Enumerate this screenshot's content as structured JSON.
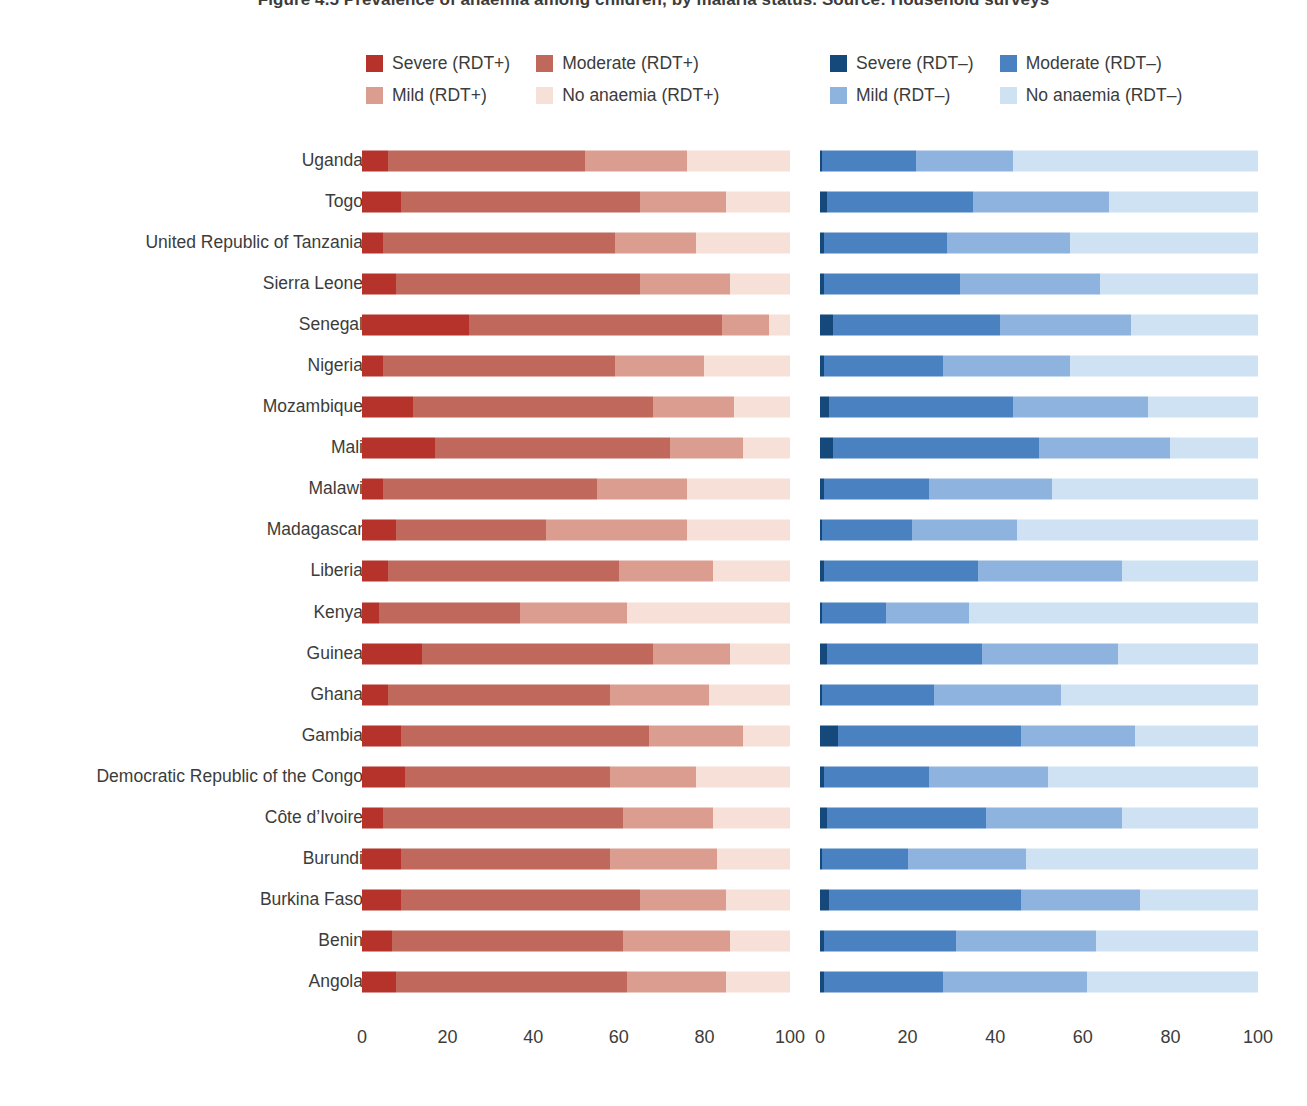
{
  "title": "Figure 4.5 Prevalence of anaemia among children, by malaria status. Source: Household surveys",
  "legend": {
    "rdt_positive": [
      {
        "label": "Severe (RDT+)",
        "color": "#b5332b",
        "key": "severe_pos"
      },
      {
        "label": "Moderate (RDT+)",
        "color": "#c0685c",
        "key": "moderate_pos"
      },
      {
        "label": "Mild (RDT+)",
        "color": "#da9d8f",
        "key": "mild_pos"
      },
      {
        "label": "No anaemia (RDT+)",
        "color": "#f6e0d8",
        "key": "none_pos"
      }
    ],
    "rdt_negative": [
      {
        "label": "Severe (RDT–)",
        "color": "#15497c",
        "key": "severe_neg"
      },
      {
        "label": "Moderate (RDT–)",
        "color": "#4a81c0",
        "key": "moderate_neg"
      },
      {
        "label": "Mild (RDT–)",
        "color": "#8db3de",
        "key": "mild_neg"
      },
      {
        "label": "No anaemia (RDT–)",
        "color": "#cee2f3",
        "key": "none_neg"
      }
    ]
  },
  "axis": {
    "ticks": [
      0,
      20,
      40,
      60,
      80,
      100
    ],
    "min": 0,
    "max": 100
  },
  "chart_data": {
    "type": "bar",
    "subtype": "stacked-horizontal-100pct",
    "title": "Figure 4.5 Prevalence of anaemia among children, by malaria status. Source: Household surveys",
    "xlabel": "",
    "ylabel": "",
    "xlim": [
      0,
      100
    ],
    "grid": false,
    "legend_position": "top",
    "panels": [
      {
        "name": "RDT-positive",
        "series": [
          {
            "name": "Severe (RDT+)",
            "color": "#b5332b"
          },
          {
            "name": "Moderate (RDT+)",
            "color": "#c0685c"
          },
          {
            "name": "Mild (RDT+)",
            "color": "#da9d8f"
          },
          {
            "name": "No anaemia (RDT+)",
            "color": "#f6e0d8"
          }
        ]
      },
      {
        "name": "RDT-negative",
        "series": [
          {
            "name": "Severe (RDT–)",
            "color": "#15497c"
          },
          {
            "name": "Moderate (RDT–)",
            "color": "#4a81c0"
          },
          {
            "name": "Mild (RDT–)",
            "color": "#8db3de"
          },
          {
            "name": "No anaemia (RDT–)",
            "color": "#cee2f3"
          }
        ]
      }
    ],
    "categories": [
      "Uganda",
      "Togo",
      "United Republic of Tanzania",
      "Sierra Leone",
      "Senegal",
      "Nigeria",
      "Mozambique",
      "Mali",
      "Malawi",
      "Madagascar",
      "Liberia",
      "Kenya",
      "Guinea",
      "Ghana",
      "Gambia",
      "Democratic Republic of the Congo",
      "Côte d’Ivoire",
      "Burundi",
      "Burkina Faso",
      "Benin",
      "Angola"
    ],
    "rows": [
      {
        "country": "Uganda",
        "rdt_pos": [
          6,
          46,
          24,
          24
        ],
        "rdt_neg": [
          0.5,
          21.5,
          22,
          56
        ]
      },
      {
        "country": "Togo",
        "rdt_pos": [
          9,
          56,
          20,
          15
        ],
        "rdt_neg": [
          1.5,
          33.5,
          31,
          34
        ]
      },
      {
        "country": "United Republic of Tanzania",
        "rdt_pos": [
          5,
          54,
          19,
          22
        ],
        "rdt_neg": [
          1,
          28,
          28,
          43
        ]
      },
      {
        "country": "Sierra Leone",
        "rdt_pos": [
          8,
          57,
          21,
          14
        ],
        "rdt_neg": [
          1,
          31,
          32,
          36
        ]
      },
      {
        "country": "Senegal",
        "rdt_pos": [
          25,
          59,
          11,
          5
        ],
        "rdt_neg": [
          3,
          38,
          30,
          29
        ]
      },
      {
        "country": "Nigeria",
        "rdt_pos": [
          5,
          54,
          21,
          20
        ],
        "rdt_neg": [
          1,
          27,
          29,
          43
        ]
      },
      {
        "country": "Mozambique",
        "rdt_pos": [
          12,
          56,
          19,
          13
        ],
        "rdt_neg": [
          2,
          42,
          31,
          25
        ]
      },
      {
        "country": "Mali",
        "rdt_pos": [
          17,
          55,
          17,
          11
        ],
        "rdt_neg": [
          3,
          47,
          30,
          20
        ]
      },
      {
        "country": "Malawi",
        "rdt_pos": [
          5,
          50,
          21,
          24
        ],
        "rdt_neg": [
          1,
          24,
          28,
          47
        ]
      },
      {
        "country": "Madagascar",
        "rdt_pos": [
          8,
          35,
          33,
          24
        ],
        "rdt_neg": [
          0.5,
          20.5,
          24,
          55
        ]
      },
      {
        "country": "Liberia",
        "rdt_pos": [
          6,
          54,
          22,
          18
        ],
        "rdt_neg": [
          1,
          35,
          33,
          31
        ]
      },
      {
        "country": "Kenya",
        "rdt_pos": [
          4,
          33,
          25,
          38
        ],
        "rdt_neg": [
          0.5,
          14.5,
          19,
          66
        ]
      },
      {
        "country": "Guinea",
        "rdt_pos": [
          14,
          54,
          18,
          14
        ],
        "rdt_neg": [
          1.5,
          35.5,
          31,
          32
        ]
      },
      {
        "country": "Ghana",
        "rdt_pos": [
          6,
          52,
          23,
          19
        ],
        "rdt_neg": [
          0.5,
          25.5,
          29,
          45
        ]
      },
      {
        "country": "Gambia",
        "rdt_pos": [
          9,
          58,
          22,
          11
        ],
        "rdt_neg": [
          4,
          42,
          26,
          28
        ]
      },
      {
        "country": "Democratic Republic of the Congo",
        "rdt_pos": [
          10,
          48,
          20,
          22
        ],
        "rdt_neg": [
          1,
          24,
          27,
          48
        ]
      },
      {
        "country": "Côte d’Ivoire",
        "rdt_pos": [
          5,
          56,
          21,
          18
        ],
        "rdt_neg": [
          1.5,
          36.5,
          31,
          31
        ]
      },
      {
        "country": "Burundi",
        "rdt_pos": [
          9,
          49,
          25,
          17
        ],
        "rdt_neg": [
          0.5,
          19.5,
          27,
          53
        ]
      },
      {
        "country": "Burkina Faso",
        "rdt_pos": [
          9,
          56,
          20,
          15
        ],
        "rdt_neg": [
          2,
          44,
          27,
          27
        ]
      },
      {
        "country": "Benin",
        "rdt_pos": [
          7,
          54,
          25,
          14
        ],
        "rdt_neg": [
          1,
          30,
          32,
          37
        ]
      },
      {
        "country": "Angola",
        "rdt_pos": [
          8,
          54,
          23,
          15
        ],
        "rdt_neg": [
          1,
          27,
          33,
          39
        ]
      }
    ]
  }
}
